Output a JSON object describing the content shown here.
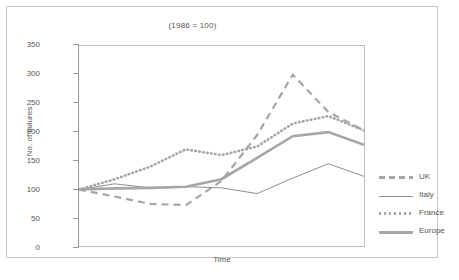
{
  "chart_data": {
    "type": "line",
    "title": "(1986 = 100)",
    "xlabel": "Time",
    "ylabel": "No. of failures",
    "ylim": [
      0,
      350
    ],
    "yticks": [
      0,
      50,
      100,
      150,
      200,
      250,
      300,
      350
    ],
    "grid": false,
    "legend_position": "right",
    "x": [
      1,
      2,
      3,
      4,
      5,
      6,
      7,
      8,
      9
    ],
    "categories": [
      "1",
      "2",
      "3",
      "4",
      "5",
      "6",
      "7",
      "8",
      "9"
    ],
    "series": [
      {
        "name": "UK",
        "style": "dashed",
        "color": "#a6a6a6",
        "values": [
          100,
          88,
          75,
          73,
          115,
          195,
          300,
          235,
          203
        ]
      },
      {
        "name": "Italy",
        "style": "thin-solid",
        "color": "#8e8e8e",
        "values": [
          100,
          110,
          103,
          105,
          103,
          93,
          120,
          145,
          123
        ]
      },
      {
        "name": "France",
        "style": "dotted",
        "color": "#a6a6a6",
        "values": [
          100,
          118,
          140,
          170,
          160,
          175,
          215,
          228,
          203
        ]
      },
      {
        "name": "Europe",
        "style": "thick-solid",
        "color": "#a6a6a6",
        "values": [
          100,
          102,
          103,
          105,
          118,
          155,
          193,
          200,
          178
        ]
      }
    ]
  },
  "axis": {
    "y_labels": [
      "350",
      "300",
      "250",
      "200",
      "150",
      "100",
      "50",
      "0"
    ],
    "y_title": "No. of failures",
    "x_title": "Time"
  },
  "title": {
    "text": "(1986 = 100)"
  },
  "legend": {
    "items": [
      {
        "label": "UK"
      },
      {
        "label": "Italy"
      },
      {
        "label": "France"
      },
      {
        "label": "Europe"
      }
    ]
  },
  "colors": {
    "line_gray": "#a6a6a6",
    "thin_gray": "#8e8e8e",
    "axis": "#9a9a9a",
    "text": "#555555",
    "frame": "#c9c9c9",
    "shadow": "#d8d8d8"
  }
}
